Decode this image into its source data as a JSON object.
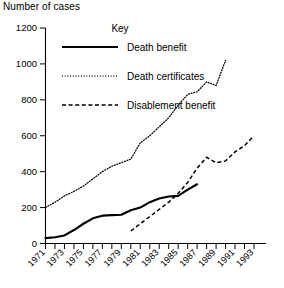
{
  "chart_data": {
    "type": "line",
    "title": "",
    "xlabel": "",
    "ylabel": "Number of cases",
    "ylim": [
      0,
      1200
    ],
    "ytick_values": [
      0,
      200,
      400,
      600,
      800,
      1000,
      1200
    ],
    "ytick_labels": [
      "0",
      "200",
      "400",
      "600",
      "800",
      "1000",
      "1200"
    ],
    "xlim": [
      1971,
      1993
    ],
    "x": [
      1971,
      1972,
      1973,
      1974,
      1975,
      1976,
      1977,
      1978,
      1979,
      1980,
      1981,
      1982,
      1983,
      1984,
      1985,
      1986,
      1987,
      1988,
      1989,
      1990,
      1991,
      1992,
      1993
    ],
    "xtick_labels": [
      "1971",
      "1973",
      "1975",
      "1977",
      "1979",
      "1981",
      "1983",
      "1985",
      "1987",
      "1989",
      "1991",
      "1993"
    ],
    "xtick_label_years": [
      1971,
      1973,
      1975,
      1977,
      1979,
      1981,
      1983,
      1985,
      1987,
      1989,
      1991,
      1993
    ],
    "grid": false,
    "legend_position": "upper-center",
    "legend_title": "Key",
    "series": [
      {
        "name": "Death benefit",
        "style": "solid",
        "x": [
          1971,
          1972,
          1973,
          1974,
          1975,
          1976,
          1977,
          1978,
          1979,
          1980,
          1981,
          1982,
          1983,
          1984,
          1985,
          1986,
          1987
        ],
        "values": [
          30,
          35,
          45,
          75,
          110,
          140,
          155,
          158,
          160,
          185,
          200,
          230,
          250,
          262,
          265,
          300,
          330
        ]
      },
      {
        "name": "Death certificates",
        "style": "dotted",
        "x": [
          1971,
          1972,
          1973,
          1974,
          1975,
          1976,
          1977,
          1978,
          1979,
          1980,
          1981,
          1982,
          1983,
          1984,
          1985,
          1986,
          1987,
          1988,
          1989,
          1990
        ],
        "values": [
          200,
          230,
          265,
          290,
          320,
          360,
          400,
          430,
          450,
          470,
          560,
          600,
          650,
          700,
          770,
          830,
          845,
          900,
          880,
          1020
        ]
      },
      {
        "name": "Disablement benefit",
        "style": "dashed",
        "x": [
          1980,
          1981,
          1982,
          1983,
          1984,
          1985,
          1986,
          1987,
          1988,
          1989,
          1990,
          1991,
          1992,
          1993
        ],
        "values": [
          70,
          110,
          150,
          190,
          230,
          280,
          340,
          420,
          480,
          450,
          460,
          510,
          545,
          600
        ]
      }
    ]
  },
  "legend": {
    "title": "Key",
    "entries": [
      {
        "label": "Death benefit",
        "style": "solid"
      },
      {
        "label": "Death certificates",
        "style": "dotted"
      },
      {
        "label": "Disablement benefit",
        "style": "dashed"
      }
    ]
  },
  "axis": {
    "y_title": "Number of cases"
  }
}
